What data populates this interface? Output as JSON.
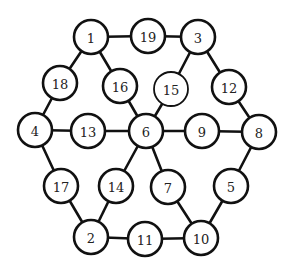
{
  "diagram": {
    "type": "graph",
    "colors": {
      "stroke": "#111111",
      "fill": "#ffffff",
      "text": "#222222"
    },
    "node_radius": 17,
    "nodes": [
      {
        "id": "1",
        "label": "1",
        "x": 91,
        "y": 37
      },
      {
        "id": "19",
        "label": "19",
        "x": 148,
        "y": 36
      },
      {
        "id": "3",
        "label": "3",
        "x": 198,
        "y": 37
      },
      {
        "id": "18",
        "label": "18",
        "x": 60,
        "y": 83
      },
      {
        "id": "16",
        "label": "16",
        "x": 120,
        "y": 86
      },
      {
        "id": "15",
        "label": "15",
        "x": 171,
        "y": 89,
        "thin": true
      },
      {
        "id": "12",
        "label": "12",
        "x": 229,
        "y": 87
      },
      {
        "id": "4",
        "label": "4",
        "x": 35,
        "y": 130
      },
      {
        "id": "13",
        "label": "13",
        "x": 88,
        "y": 131
      },
      {
        "id": "6",
        "label": "6",
        "x": 146,
        "y": 131
      },
      {
        "id": "9",
        "label": "9",
        "x": 202,
        "y": 131
      },
      {
        "id": "8",
        "label": "8",
        "x": 259,
        "y": 132
      },
      {
        "id": "17",
        "label": "17",
        "x": 61,
        "y": 186
      },
      {
        "id": "14",
        "label": "14",
        "x": 116,
        "y": 186
      },
      {
        "id": "7",
        "label": "7",
        "x": 168,
        "y": 187
      },
      {
        "id": "5",
        "label": "5",
        "x": 231,
        "y": 186
      },
      {
        "id": "2",
        "label": "2",
        "x": 91,
        "y": 237
      },
      {
        "id": "11",
        "label": "11",
        "x": 145,
        "y": 239
      },
      {
        "id": "10",
        "label": "10",
        "x": 201,
        "y": 238
      }
    ],
    "edges": [
      [
        "1",
        "19"
      ],
      [
        "19",
        "3"
      ],
      [
        "1",
        "18"
      ],
      [
        "18",
        "4"
      ],
      [
        "1",
        "16"
      ],
      [
        "16",
        "6"
      ],
      [
        "3",
        "15"
      ],
      [
        "15",
        "6"
      ],
      [
        "3",
        "12"
      ],
      [
        "12",
        "8"
      ],
      [
        "4",
        "13"
      ],
      [
        "13",
        "6"
      ],
      [
        "6",
        "9"
      ],
      [
        "9",
        "8"
      ],
      [
        "4",
        "17"
      ],
      [
        "17",
        "2"
      ],
      [
        "6",
        "14"
      ],
      [
        "14",
        "2"
      ],
      [
        "6",
        "7"
      ],
      [
        "7",
        "10"
      ],
      [
        "8",
        "5"
      ],
      [
        "5",
        "10"
      ],
      [
        "2",
        "11"
      ],
      [
        "11",
        "10"
      ]
    ]
  }
}
